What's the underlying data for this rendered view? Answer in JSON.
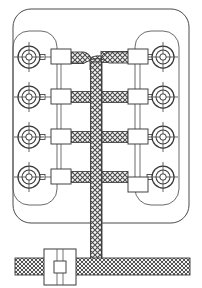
{
  "diagram": {
    "type": "wiring-harness-schematic",
    "background_color": "#ffffff",
    "line_color": "#3a3a3a",
    "cable_fill_color": "#f2f2f2",
    "cable_hatch_color": "#4a4a4a",
    "canvas": {
      "width": 202,
      "height": 288
    }
  },
  "enclosure": {
    "outer_panel": {
      "name": "outer-panel",
      "x": 13,
      "y": 9,
      "width": 176,
      "height": 214,
      "radius": 18,
      "stroke": "#4a4a4a",
      "fill": "none"
    },
    "left_bay": {
      "name": "left-sensor-bay",
      "x": 13,
      "y": 31,
      "width": 44,
      "height": 174,
      "radius": 16,
      "stroke": "#555555",
      "fill": "none"
    },
    "right_bay": {
      "name": "right-sensor-bay",
      "x": 135,
      "y": 31,
      "width": 44,
      "height": 174,
      "radius": 16,
      "stroke": "#555555",
      "fill": "none"
    }
  },
  "trunk": {
    "name": "main-cable-trunk",
    "x_center": 96,
    "thickness": 11,
    "top_y": 50,
    "bottom_y": 266,
    "branch_top_y": 57,
    "corner_radius": 7
  },
  "bottom_cable": {
    "name": "main-bus-cable",
    "x": 15,
    "y": 258,
    "width": 175,
    "height": 17,
    "label": "main bus"
  },
  "junction_box": {
    "name": "inline-junction-box",
    "x": 44,
    "y": 249,
    "width": 32,
    "height": 36,
    "inner_rect": {
      "x": 54,
      "y": 261,
      "width": 12,
      "height": 12
    },
    "label": "J1"
  },
  "rows": [
    {
      "index": 1,
      "y": 57,
      "label": "row-1"
    },
    {
      "index": 2,
      "y": 97,
      "label": "row-2"
    },
    {
      "index": 3,
      "y": 137,
      "label": "row-3"
    },
    {
      "index": 4,
      "y": 177,
      "label": "row-4"
    }
  ],
  "sensors": [
    {
      "id": "L1",
      "side": "left",
      "cx": 29,
      "cy": 57,
      "label": "L1"
    },
    {
      "id": "L2",
      "side": "left",
      "cx": 29,
      "cy": 97,
      "label": "L2"
    },
    {
      "id": "L3",
      "side": "left",
      "cx": 29,
      "cy": 137,
      "label": "L3"
    },
    {
      "id": "L4",
      "side": "left",
      "cx": 29,
      "cy": 177,
      "label": "L4"
    },
    {
      "id": "R1",
      "side": "right",
      "cx": 163,
      "cy": 57,
      "label": "R1"
    },
    {
      "id": "R2",
      "side": "right",
      "cx": 163,
      "cy": 97,
      "label": "R2"
    },
    {
      "id": "R3",
      "side": "right",
      "cx": 163,
      "cy": 137,
      "label": "R3"
    },
    {
      "id": "R4",
      "side": "right",
      "cx": 163,
      "cy": 177,
      "label": "R4"
    }
  ],
  "sensor_geometry": {
    "outer_radius": 11,
    "mid_radius": 7,
    "inner_radius": 3.2,
    "crosshair_extent": 15,
    "stub_length": 8,
    "stub_height": 5
  },
  "connectors": [
    {
      "id": "CL1",
      "side": "left",
      "x": 51,
      "y": 49,
      "width": 20,
      "height": 15,
      "label": "CL1"
    },
    {
      "id": "CL2",
      "side": "left",
      "x": 51,
      "y": 89,
      "width": 20,
      "height": 15,
      "label": "CL2"
    },
    {
      "id": "CL3",
      "side": "left",
      "x": 51,
      "y": 129,
      "width": 20,
      "height": 15,
      "label": "CL3"
    },
    {
      "id": "CL4",
      "side": "left",
      "x": 51,
      "y": 169,
      "width": 20,
      "height": 15,
      "label": "CL4"
    },
    {
      "id": "CR1",
      "side": "right",
      "x": 128,
      "y": 49,
      "width": 20,
      "height": 15,
      "label": "CR1"
    },
    {
      "id": "CR2",
      "side": "right",
      "x": 128,
      "y": 89,
      "width": 20,
      "height": 15,
      "label": "CR2"
    },
    {
      "id": "CR3",
      "side": "right",
      "x": 128,
      "y": 129,
      "width": 20,
      "height": 15,
      "label": "CR3"
    },
    {
      "id": "CR4",
      "side": "right",
      "x": 128,
      "y": 177,
      "width": 20,
      "height": 15,
      "label": "CR4"
    }
  ],
  "branches": [
    {
      "id": "B-L1",
      "side": "left",
      "row": 1,
      "from_x": 71,
      "to_x": 91,
      "y": 57,
      "kind": "branch-cable"
    },
    {
      "id": "B-L2",
      "side": "left",
      "row": 2,
      "from_x": 71,
      "to_x": 91,
      "y": 97,
      "kind": "branch-cable"
    },
    {
      "id": "B-L3",
      "side": "left",
      "row": 3,
      "from_x": 71,
      "to_x": 91,
      "y": 137,
      "kind": "branch-cable"
    },
    {
      "id": "B-L4",
      "side": "left",
      "row": 4,
      "from_x": 71,
      "to_x": 91,
      "y": 177,
      "kind": "branch-cable"
    },
    {
      "id": "B-R1",
      "side": "right",
      "row": 1,
      "from_x": 101,
      "to_x": 128,
      "y": 57,
      "kind": "branch-cable"
    },
    {
      "id": "B-R2",
      "side": "right",
      "row": 2,
      "from_x": 101,
      "to_x": 128,
      "y": 97,
      "kind": "branch-cable"
    },
    {
      "id": "B-R3",
      "side": "right",
      "row": 3,
      "from_x": 101,
      "to_x": 128,
      "y": 137,
      "kind": "branch-cable"
    },
    {
      "id": "B-R4",
      "side": "right",
      "row": 4,
      "from_x": 101,
      "to_x": 128,
      "y": 177,
      "kind": "branch-cable"
    }
  ],
  "leads": {
    "name": "sensor-lead-line",
    "stroke": "#555555",
    "note": "thin single line from sensor stub to connector body"
  },
  "counts": {
    "sensors_total": 8,
    "sensors_per_side": 4,
    "rows": 4,
    "connectors_total": 8,
    "junction_boxes": 1
  }
}
